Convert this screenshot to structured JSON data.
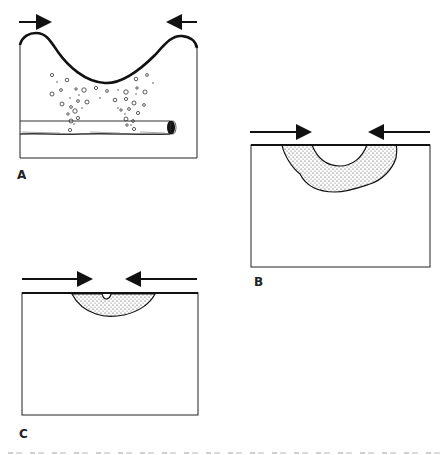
{
  "figure": {
    "panels": [
      {
        "id": "A",
        "label": "A",
        "features": [
          "compression-arrows",
          "curved-surface",
          "bubbles",
          "horizontal-tube"
        ]
      },
      {
        "id": "B",
        "label": "B",
        "features": [
          "compression-arrows",
          "deep-stippled-depression"
        ]
      },
      {
        "id": "C",
        "label": "C",
        "features": [
          "compression-arrows",
          "shallow-stippled-depression",
          "surface-notch"
        ]
      }
    ],
    "colors": {
      "ink": "#111111",
      "background": "#ffffff",
      "stipple": "#333333"
    },
    "caption_note": "clipped caption text at bottom edge (illegible)"
  }
}
